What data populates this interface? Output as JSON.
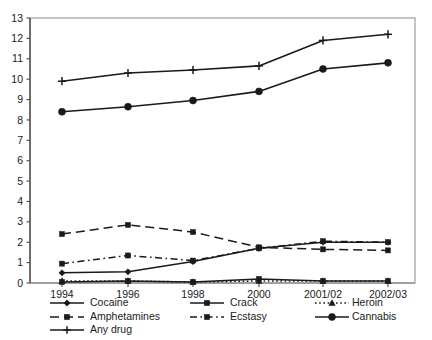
{
  "chart_data": {
    "type": "line",
    "title": "",
    "subtitle": "",
    "xlabel": "",
    "ylabel": "",
    "xlim_categories": [
      "1994",
      "1996",
      "1998",
      "2000",
      "2001/02",
      "2002/03"
    ],
    "ylim": [
      0,
      13
    ],
    "ytick_labels": [
      "0",
      "1",
      "2",
      "3",
      "4",
      "5",
      "6",
      "7",
      "8",
      "9",
      "10",
      "11",
      "12",
      "13"
    ],
    "ytick_values": [
      0,
      1,
      2,
      3,
      4,
      5,
      6,
      7,
      8,
      9,
      10,
      11,
      12,
      13
    ],
    "grid": false,
    "legend_position": "bottom",
    "categories": [
      "1994",
      "1996",
      "1998",
      "2000",
      "2001/02",
      "2002/03"
    ],
    "series": [
      {
        "name": "Cocaine",
        "marker": "diamond",
        "line_style": "solid",
        "color": "#1a1a1a",
        "values": [
          0.5,
          0.55,
          1.05,
          1.7,
          2.0,
          2.0
        ]
      },
      {
        "name": "Crack",
        "marker": "square",
        "line_style": "solid",
        "color": "#1a1a1a",
        "values": [
          0.05,
          0.1,
          0.05,
          0.2,
          0.1,
          0.1
        ]
      },
      {
        "name": "Heroin",
        "marker": "triangle",
        "line_style": "dotted",
        "color": "#1a1a1a",
        "values": [
          0.1,
          0.1,
          0.05,
          0.1,
          0.1,
          0.1
        ]
      },
      {
        "name": "Amphetamines",
        "marker": "square",
        "line_style": "dashed",
        "color": "#1a1a1a",
        "values": [
          2.4,
          2.85,
          2.5,
          1.75,
          1.65,
          1.6
        ]
      },
      {
        "name": "Ecstasy",
        "marker": "square",
        "line_style": "dashdot",
        "color": "#1a1a1a",
        "values": [
          0.95,
          1.35,
          1.1,
          1.7,
          2.05,
          2.0
        ]
      },
      {
        "name": "Cannabis",
        "marker": "circle",
        "line_style": "solid",
        "color": "#1a1a1a",
        "values": [
          8.4,
          8.65,
          8.95,
          9.4,
          10.5,
          10.8
        ]
      },
      {
        "name": "Any drug",
        "marker": "plus",
        "line_style": "solid",
        "color": "#1a1a1a",
        "values": [
          9.9,
          10.3,
          10.45,
          10.65,
          11.9,
          12.2
        ]
      }
    ]
  },
  "legend": {
    "entries": [
      {
        "label": "Cocaine",
        "marker": "diamond",
        "line_style": "solid"
      },
      {
        "label": "Crack",
        "marker": "square",
        "line_style": "solid"
      },
      {
        "label": "Heroin",
        "marker": "triangle",
        "line_style": "dotted"
      },
      {
        "label": "Amphetamines",
        "marker": "square",
        "line_style": "dashed"
      },
      {
        "label": "Ecstasy",
        "marker": "square",
        "line_style": "dashdot"
      },
      {
        "label": "Cannabis",
        "marker": "circle",
        "line_style": "solid"
      },
      {
        "label": "Any drug",
        "marker": "plus",
        "line_style": "solid"
      }
    ]
  },
  "axes": {
    "y_labels": [
      "13",
      "12",
      "11",
      "10",
      "9",
      "8",
      "7",
      "6",
      "5",
      "4",
      "3",
      "2",
      "1",
      "0"
    ],
    "x_labels": [
      "1994",
      "1996",
      "1998",
      "2000",
      "2001/02",
      "2002/03"
    ]
  },
  "colors": {
    "ink": "#1a1a1a",
    "frame": "#8a8a8a",
    "background": "#ffffff"
  }
}
